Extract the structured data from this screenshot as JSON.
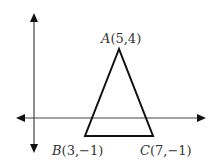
{
  "diagram": {
    "type": "coordinate-plane-triangle",
    "axes": {
      "x_axis": "horizontal double-arrow",
      "y_axis": "vertical double-arrow"
    },
    "points": [
      {
        "name": "A",
        "coords": "(5,4)",
        "label": "A(5,4)"
      },
      {
        "name": "B",
        "coords": "(3,−1)",
        "label": "B(3,−1)"
      },
      {
        "name": "C",
        "coords": "(7,−1)",
        "label": "C(7,−1)"
      }
    ],
    "labels": {
      "A": {
        "letter": "A",
        "coords": "(5,4)"
      },
      "B": {
        "letter": "B",
        "coords": "(3,−1)"
      },
      "C": {
        "letter": "C",
        "coords": "(7,−1)"
      }
    },
    "colors": {
      "axis": "#444444",
      "triangle": "#111111",
      "text": "#333333"
    }
  }
}
